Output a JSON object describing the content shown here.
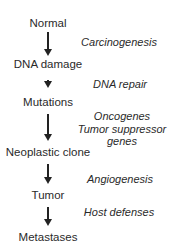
{
  "diagram": {
    "nodes": [
      {
        "label": "Normal"
      },
      {
        "label": "DNA damage"
      },
      {
        "label": "Mutations"
      },
      {
        "label": "Neoplastic clone"
      },
      {
        "label": "Tumor"
      },
      {
        "label": "Metastases"
      }
    ],
    "transitions": [
      {
        "label": "Carcinogenesis"
      },
      {
        "label": "DNA repair"
      },
      {
        "label": "Oncogenes\nTumor suppressor\ngenes",
        "lines": [
          "Oncogenes",
          "Tumor suppressor",
          "genes"
        ]
      },
      {
        "label": "Angiogenesis"
      },
      {
        "label": "Host defenses"
      }
    ]
  }
}
